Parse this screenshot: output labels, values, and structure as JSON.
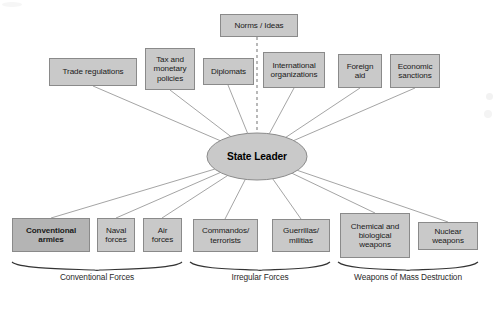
{
  "diagram": {
    "center": {
      "label": "State Leader",
      "shape": "ellipse",
      "fill": "#c9c9c9",
      "stroke": "#8a8a8a"
    },
    "divider": {
      "name": "dashed-vertical-divider",
      "style": "dashed",
      "color": "#8a8a8a"
    },
    "top_boxes": [
      {
        "label": "Norms / Ideas",
        "x": 220,
        "y": 14,
        "w": 78,
        "h": 23,
        "bold": false,
        "anchor_x": 259,
        "anchor_y": 37
      },
      {
        "label": "Trade regulations",
        "x": 49,
        "y": 58,
        "w": 88,
        "h": 28,
        "bold": false,
        "anchor_x": 93,
        "anchor_y": 86
      },
      {
        "label": "Tax and monetary policies",
        "x": 145,
        "y": 48,
        "w": 50,
        "h": 42,
        "bold": false,
        "anchor_x": 170,
        "anchor_y": 90
      },
      {
        "label": "Diplomats",
        "x": 203,
        "y": 58,
        "w": 51,
        "h": 27,
        "bold": false,
        "anchor_x": 228,
        "anchor_y": 85
      },
      {
        "label": "International organizations",
        "x": 263,
        "y": 52,
        "w": 62,
        "h": 36,
        "bold": false,
        "anchor_x": 294,
        "anchor_y": 88
      },
      {
        "label": "Foreign aid",
        "x": 338,
        "y": 54,
        "w": 44,
        "h": 34,
        "bold": false,
        "anchor_x": 360,
        "anchor_y": 88
      },
      {
        "label": "Economic sanctions",
        "x": 390,
        "y": 54,
        "w": 50,
        "h": 34,
        "bold": false,
        "anchor_x": 415,
        "anchor_y": 88
      }
    ],
    "bottom_boxes": [
      {
        "label": "Conventional armies",
        "x": 12,
        "y": 218,
        "w": 78,
        "h": 34,
        "bold": true,
        "anchor_x": 51,
        "anchor_y": 218
      },
      {
        "label": "Naval forces",
        "x": 97,
        "y": 218,
        "w": 38,
        "h": 34,
        "bold": false,
        "anchor_x": 116,
        "anchor_y": 218
      },
      {
        "label": "Air forces",
        "x": 143,
        "y": 218,
        "w": 39,
        "h": 34,
        "bold": false,
        "anchor_x": 162,
        "anchor_y": 218
      },
      {
        "label": "Commandos/ terrorists",
        "x": 193,
        "y": 219,
        "w": 65,
        "h": 33,
        "bold": false,
        "anchor_x": 225,
        "anchor_y": 219
      },
      {
        "label": "Guerrillas/ militias",
        "x": 272,
        "y": 219,
        "w": 58,
        "h": 33,
        "bold": false,
        "anchor_x": 301,
        "anchor_y": 219
      },
      {
        "label": "Chemical and biological weapons",
        "x": 340,
        "y": 213,
        "w": 70,
        "h": 45,
        "bold": false,
        "anchor_x": 375,
        "anchor_y": 213
      },
      {
        "label": "Nuclear weapons",
        "x": 418,
        "y": 222,
        "w": 60,
        "h": 28,
        "bold": false,
        "anchor_x": 448,
        "anchor_y": 222
      }
    ],
    "groups": [
      {
        "label": "Conventional Forces",
        "x1": 12,
        "x2": 182,
        "label_x": 97,
        "label_y": 276
      },
      {
        "label": "Irregular Forces",
        "x1": 190,
        "x2": 330,
        "label_x": 260,
        "label_y": 276
      },
      {
        "label": "Weapons of Mass Destruction",
        "x1": 338,
        "x2": 478,
        "label_x": 408,
        "label_y": 276
      }
    ],
    "brace_y": 262,
    "connector_color": "#9a9a9a"
  }
}
